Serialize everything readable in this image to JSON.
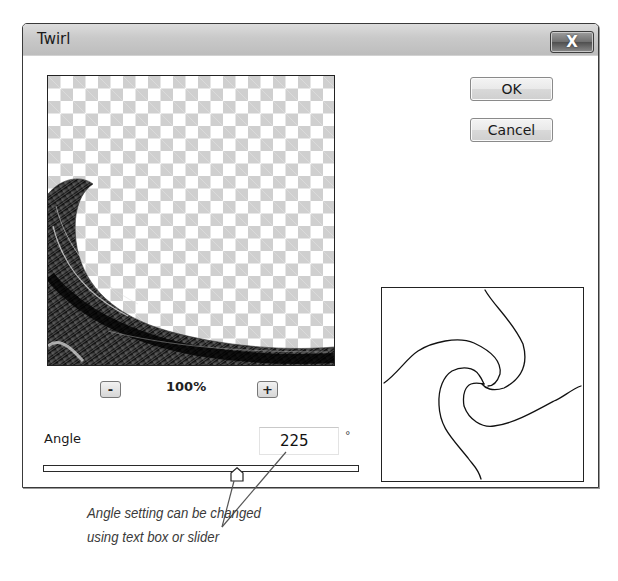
{
  "dialog": {
    "title": "Twirl",
    "close_label": "X",
    "buttons": {
      "ok": "OK",
      "cancel": "Cancel"
    },
    "preview": {
      "zoom_out_label": "-",
      "zoom_in_label": "+",
      "zoom_level": "100%"
    },
    "angle": {
      "label": "Angle",
      "value": "225",
      "unit": "°",
      "slider_position_pct": 61
    }
  },
  "annotation": {
    "line1": "Angle setting can be changed",
    "line2": "using text box or slider"
  },
  "colors": {
    "titlebar": "#c9c9c9",
    "checker_gray": "#cfcfcf",
    "checker_white": "#ffffff",
    "annotation_line": "#555555"
  }
}
